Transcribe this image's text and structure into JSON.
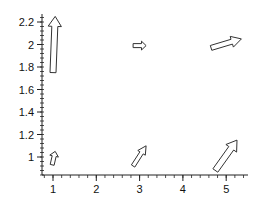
{
  "chart_data": {
    "type": "quiver",
    "title": "",
    "xlabel": "",
    "ylabel": "",
    "xlim": [
      0.75,
      5.5
    ],
    "ylim": [
      0.84,
      2.27
    ],
    "grid": false,
    "legend": null,
    "x_ticks": [
      "1",
      "2",
      "3",
      "4",
      "5"
    ],
    "y_ticks": [
      "1",
      "1.2",
      "1.4",
      "1.6",
      "1.8",
      "2",
      "2.2"
    ],
    "arrows": [
      {
        "x": 1.0,
        "y": 1.75,
        "u": 0.05,
        "v": 0.5
      },
      {
        "x": 0.98,
        "y": 0.93,
        "u": 0.07,
        "v": 0.12
      },
      {
        "x": 2.85,
        "y": 1.99,
        "u": 0.3,
        "v": 0.0
      },
      {
        "x": 2.85,
        "y": 0.92,
        "u": 0.3,
        "v": 0.18
      },
      {
        "x": 4.65,
        "y": 1.97,
        "u": 0.7,
        "v": 0.08
      },
      {
        "x": 4.75,
        "y": 0.88,
        "u": 0.5,
        "v": 0.27
      }
    ],
    "arrow_style": "outlined-block",
    "colors": {
      "axis": "#222222",
      "arrow_stroke": "#333333",
      "arrow_fill": "#ffffff",
      "background": "#ffffff"
    }
  }
}
